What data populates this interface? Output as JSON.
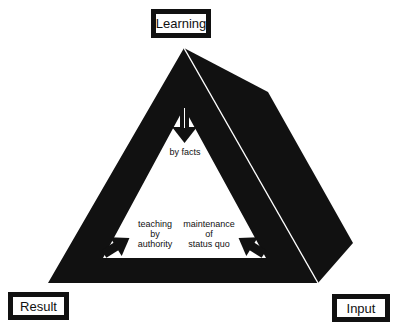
{
  "diagram": {
    "type": "3d-triangle-concept-diagram",
    "colors": {
      "fill": "#111111",
      "background": "#ffffff",
      "highlight_line": "#ffffff"
    },
    "corner_boxes": {
      "top": {
        "label": "Learning"
      },
      "bottom_left": {
        "label": "Result"
      },
      "bottom_right": {
        "label": "Input"
      }
    },
    "inner_labels": {
      "top": "by facts",
      "left": {
        "line1": "teaching",
        "line2": "by",
        "line3": "authority"
      },
      "right": {
        "line1": "maintenance",
        "line2": "of",
        "line3": "status quo"
      }
    },
    "arrows": [
      {
        "name": "arrow-down-icon",
        "direction": "down",
        "position": "top"
      },
      {
        "name": "arrow-up-right-icon",
        "direction": "up-right",
        "position": "bottom-left"
      },
      {
        "name": "arrow-up-left-icon",
        "direction": "up-left",
        "position": "bottom-right"
      }
    ]
  }
}
